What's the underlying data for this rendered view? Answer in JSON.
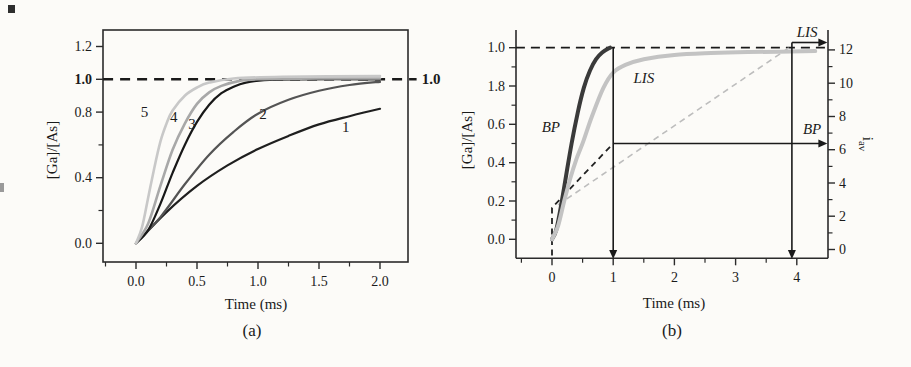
{
  "figure": {
    "background": "#fcfbf8",
    "panels": [
      {
        "caption": "(a)",
        "x_title": "Time (ms)",
        "y_title": "[Ga]/[As]"
      },
      {
        "caption": "(b)",
        "x_title": "Time (ms)",
        "y_title": "[Ga]/[As]",
        "right_y_title_main": "i",
        "right_y_title_sub": "av"
      }
    ]
  },
  "chart_data": [
    {
      "type": "line",
      "panel": "a",
      "title": "",
      "xlabel": "Time (ms)",
      "ylabel": "[Ga]/[As]",
      "xlim": [
        -0.27,
        2.23
      ],
      "ylim": [
        -0.11,
        1.3
      ],
      "grid": false,
      "frame": "box",
      "axis_color": "#2b2b2b",
      "x_ticks": [
        {
          "v": 0.0,
          "label": "0.0"
        },
        {
          "v": 0.5,
          "label": "0.5"
        },
        {
          "v": 1.0,
          "label": "1.0"
        },
        {
          "v": 1.5,
          "label": "1.5"
        },
        {
          "v": 2.0,
          "label": "2.0"
        }
      ],
      "x_minor_ticks": [
        -0.25,
        0.25,
        0.75,
        1.25,
        1.75
      ],
      "y_ticks": [
        {
          "v": 0.0,
          "label": "0.0"
        },
        {
          "v": 0.4,
          "label": "0.4"
        },
        {
          "v": 0.8,
          "label": "0.8"
        },
        {
          "v": 1.0,
          "label": "1.0",
          "bold": true
        },
        {
          "v": 1.2,
          "label": "1.2"
        }
      ],
      "y_minor_ticks": [
        0.2,
        0.6
      ],
      "series": [
        {
          "name": "1",
          "color": "#1f1f1f",
          "width": 2.2,
          "points": [
            [
              0,
              0
            ],
            [
              0.25,
              0.19
            ],
            [
              0.5,
              0.35
            ],
            [
              0.75,
              0.475
            ],
            [
              1.0,
              0.575
            ],
            [
              1.25,
              0.655
            ],
            [
              1.5,
              0.725
            ],
            [
              1.75,
              0.775
            ],
            [
              2.0,
              0.82
            ]
          ]
        },
        {
          "name": "2",
          "color": "#545454",
          "width": 2.2,
          "points": [
            [
              0,
              0
            ],
            [
              0.2,
              0.16
            ],
            [
              0.4,
              0.36
            ],
            [
              0.6,
              0.54
            ],
            [
              0.8,
              0.68
            ],
            [
              1.0,
              0.79
            ],
            [
              1.25,
              0.875
            ],
            [
              1.5,
              0.93
            ],
            [
              1.75,
              0.965
            ],
            [
              2.0,
              0.985
            ]
          ]
        },
        {
          "name": "3",
          "color": "#181818",
          "width": 2.2,
          "points": [
            [
              0,
              0
            ],
            [
              0.1,
              0.08
            ],
            [
              0.2,
              0.24
            ],
            [
              0.3,
              0.43
            ],
            [
              0.4,
              0.6
            ],
            [
              0.5,
              0.74
            ],
            [
              0.6,
              0.845
            ],
            [
              0.7,
              0.915
            ],
            [
              0.8,
              0.955
            ],
            [
              0.9,
              0.98
            ],
            [
              1.05,
              0.995
            ],
            [
              1.3,
              1.0
            ],
            [
              2.0,
              1.0
            ]
          ]
        },
        {
          "name": "4",
          "color": "#a8a8a8",
          "width": 2.6,
          "points": [
            [
              0,
              0
            ],
            [
              0.1,
              0.12
            ],
            [
              0.2,
              0.35
            ],
            [
              0.3,
              0.57
            ],
            [
              0.4,
              0.73
            ],
            [
              0.5,
              0.85
            ],
            [
              0.6,
              0.92
            ],
            [
              0.7,
              0.96
            ],
            [
              0.85,
              0.99
            ],
            [
              1.0,
              1.0
            ],
            [
              1.5,
              1.005
            ],
            [
              2.0,
              1.005
            ]
          ]
        },
        {
          "name": "5",
          "color": "#c8c8c8",
          "width": 2.6,
          "points": [
            [
              0,
              0
            ],
            [
              0.05,
              0.1
            ],
            [
              0.1,
              0.28
            ],
            [
              0.15,
              0.46
            ],
            [
              0.2,
              0.62
            ],
            [
              0.25,
              0.73
            ],
            [
              0.3,
              0.81
            ],
            [
              0.4,
              0.9
            ],
            [
              0.5,
              0.95
            ],
            [
              0.6,
              0.98
            ],
            [
              0.8,
              1.005
            ],
            [
              1.2,
              1.015
            ],
            [
              2.0,
              1.02
            ]
          ]
        }
      ],
      "annotations": [
        {
          "type": "dash-h",
          "name": "saturation-dashed-line",
          "y": 1.0,
          "x1": -0.27,
          "x2": 2.3,
          "color": "#1a1a1a",
          "width": 2.4,
          "dash": "10,7"
        },
        {
          "type": "text",
          "name": "saturation-value-label",
          "x": 2.42,
          "y": 1.0,
          "label": "1.0",
          "bold": true,
          "size": 15
        },
        {
          "type": "text",
          "name": "curve-label-5",
          "x": 0.07,
          "y": 0.8,
          "label": "5",
          "size": 15
        },
        {
          "type": "text",
          "name": "curve-label-4",
          "x": 0.31,
          "y": 0.77,
          "label": "4",
          "size": 15
        },
        {
          "type": "text",
          "name": "curve-label-3",
          "x": 0.46,
          "y": 0.73,
          "label": "3",
          "size": 15
        },
        {
          "type": "text",
          "name": "curve-label-2",
          "x": 1.04,
          "y": 0.79,
          "label": "2",
          "size": 15
        },
        {
          "type": "text",
          "name": "curve-label-1",
          "x": 1.72,
          "y": 0.71,
          "label": "1",
          "size": 15
        }
      ]
    },
    {
      "type": "line",
      "panel": "b",
      "title": "",
      "xlabel": "Time (ms)",
      "ylabel": "[Ga]/[As]",
      "right_ylabel": "i_av",
      "xlim": [
        -0.59,
        4.51
      ],
      "ylim": [
        -0.1,
        1.09
      ],
      "right_ylim": [
        -0.53,
        13.2
      ],
      "grid": false,
      "frame": "left-bottom-right",
      "axis_color": "#2b2b2b",
      "x_ticks": [
        {
          "v": 0,
          "label": "0"
        },
        {
          "v": 1,
          "label": "1"
        },
        {
          "v": 2,
          "label": "2"
        },
        {
          "v": 3,
          "label": "3"
        },
        {
          "v": 4,
          "label": "4"
        }
      ],
      "x_minor_ticks": [
        -0.5,
        0.5,
        1.5,
        2.5,
        3.5
      ],
      "y_ticks": [
        {
          "v": 0.0,
          "label": "0.0"
        },
        {
          "v": 0.2,
          "label": "0.2"
        },
        {
          "v": 0.4,
          "label": "0.4"
        },
        {
          "v": 0.6,
          "label": "0.6"
        },
        {
          "v": 0.8,
          "label": "1.8"
        },
        {
          "v": 1.0,
          "label": "1.0"
        }
      ],
      "y_minor_ticks": [
        0.1,
        0.3,
        0.5,
        0.7,
        0.9
      ],
      "right_y_ticks": [
        {
          "v": 0,
          "label": "0"
        },
        {
          "v": 2,
          "label": "2"
        },
        {
          "v": 4,
          "label": "4"
        },
        {
          "v": 6,
          "label": "6"
        },
        {
          "v": 8,
          "label": "8"
        },
        {
          "v": 10,
          "label": "10"
        },
        {
          "v": 12,
          "label": "12"
        }
      ],
      "right_y_minor_ticks": [
        1,
        3,
        5,
        7,
        9,
        11
      ],
      "series": [
        {
          "name": "BP",
          "color": "#3a3a3a",
          "width": 4,
          "points": [
            [
              0,
              0
            ],
            [
              0.07,
              0.05
            ],
            [
              0.15,
              0.18
            ],
            [
              0.25,
              0.37
            ],
            [
              0.32,
              0.5
            ],
            [
              0.42,
              0.66
            ],
            [
              0.52,
              0.79
            ],
            [
              0.62,
              0.88
            ],
            [
              0.72,
              0.94
            ],
            [
              0.82,
              0.975
            ],
            [
              0.95,
              1.0
            ]
          ]
        },
        {
          "name": "LIS",
          "color": "#c3c3c3",
          "width": 4,
          "points": [
            [
              0,
              0
            ],
            [
              0.1,
              0.07
            ],
            [
              0.2,
              0.2
            ],
            [
              0.3,
              0.32
            ],
            [
              0.4,
              0.42
            ],
            [
              0.51,
              0.51
            ],
            [
              0.65,
              0.64
            ],
            [
              0.84,
              0.79
            ],
            [
              1.0,
              0.87
            ],
            [
              1.2,
              0.91
            ],
            [
              1.5,
              0.94
            ],
            [
              2.0,
              0.962
            ],
            [
              2.6,
              0.972
            ],
            [
              3.2,
              0.977
            ],
            [
              4.3,
              0.982
            ]
          ]
        }
      ],
      "annotations": [
        {
          "type": "dash-h",
          "name": "unity-dashed-line",
          "y": 1.0,
          "x1": -0.59,
          "x2": 4.54,
          "color": "#1a1a1a",
          "width": 1.8,
          "dash": "9,6"
        },
        {
          "type": "dash-poly",
          "name": "bp-average-dashed",
          "color": "#222222",
          "width": 1.8,
          "dash": "6,4.5",
          "points": [
            [
              0,
              -0.085
            ],
            [
              0,
              0.165
            ],
            [
              1,
              0.5
            ]
          ]
        },
        {
          "type": "dash-poly",
          "name": "lis-average-dashed",
          "color": "#bdbdbd",
          "width": 1.6,
          "dash": "6,4.5",
          "points": [
            [
              0.1,
              0.18
            ],
            [
              3.92,
              1.01
            ]
          ]
        },
        {
          "type": "varrow",
          "name": "t1-marker-arrow",
          "x": 1.0,
          "y1": 1.0,
          "y2": -0.103
        },
        {
          "type": "varrow",
          "name": "t39-marker-arrow",
          "x": 3.92,
          "y1": 1.027,
          "y2": -0.103
        },
        {
          "type": "harrow",
          "name": "bp-iav-arrow",
          "y": 0.5,
          "x1": 1.0,
          "x2": 4.5
        },
        {
          "type": "harrow",
          "name": "lis-iav-arrow",
          "y": 1.027,
          "x1": 3.92,
          "x2": 4.5
        },
        {
          "type": "text",
          "name": "bp-curve-label",
          "x": -0.02,
          "y": 0.585,
          "label": "BP",
          "italic": true,
          "size": 15
        },
        {
          "type": "text",
          "name": "lis-curve-label",
          "x": 1.5,
          "y": 0.84,
          "label": "LIS",
          "italic": true,
          "size": 15
        },
        {
          "type": "text",
          "name": "bp-arrow-label",
          "x": 4.25,
          "y": 0.575,
          "label": "BP",
          "italic": true,
          "size": 15
        },
        {
          "type": "text",
          "name": "lis-arrow-label",
          "x": 4.17,
          "y": 1.083,
          "label": "LIS",
          "italic": true,
          "size": 15
        }
      ]
    }
  ]
}
